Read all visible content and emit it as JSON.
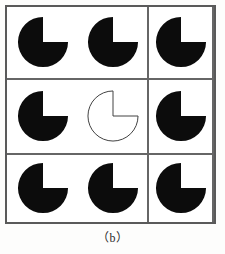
{
  "figure": {
    "caption": "（b）",
    "grid": {
      "rows": 3,
      "columns": 3,
      "border_color": "#5a5a5a",
      "divider_color": "#666666",
      "cell_background": "#ffffff"
    },
    "shape_defaults": {
      "name": "pacman",
      "wedge_start_deg": 0,
      "wedge_end_deg": 90,
      "wedge_span_deg": 90,
      "wedge_direction": "upper-right",
      "radius_px": 26
    },
    "cells": [
      {
        "index": 0,
        "row": 0,
        "column": 0,
        "position_label": "top-left",
        "shape": "pacman",
        "fill": "#0c0c0c",
        "stroke": "none",
        "stroke_width": 0,
        "filled": true,
        "wedge_start_deg": 0,
        "wedge_end_deg": 90
      },
      {
        "index": 1,
        "row": 0,
        "column": 1,
        "position_label": "top-center",
        "shape": "pacman",
        "fill": "#0c0c0c",
        "stroke": "none",
        "stroke_width": 0,
        "filled": true,
        "wedge_start_deg": 0,
        "wedge_end_deg": 90
      },
      {
        "index": 2,
        "row": 0,
        "column": 2,
        "position_label": "top-right",
        "shape": "pacman",
        "fill": "#0c0c0c",
        "stroke": "none",
        "stroke_width": 0,
        "filled": true,
        "wedge_start_deg": 0,
        "wedge_end_deg": 90
      },
      {
        "index": 3,
        "row": 1,
        "column": 0,
        "position_label": "middle-left",
        "shape": "pacman",
        "fill": "#0c0c0c",
        "stroke": "none",
        "stroke_width": 0,
        "filled": true,
        "wedge_start_deg": 0,
        "wedge_end_deg": 90
      },
      {
        "index": 4,
        "row": 1,
        "column": 1,
        "position_label": "middle-center",
        "shape": "pacman",
        "fill": "#ffffff",
        "stroke": "#3a3a3a",
        "stroke_width": 1,
        "filled": false,
        "wedge_start_deg": 0,
        "wedge_end_deg": 90
      },
      {
        "index": 5,
        "row": 1,
        "column": 2,
        "position_label": "middle-right",
        "shape": "pacman",
        "fill": "#0c0c0c",
        "stroke": "none",
        "stroke_width": 0,
        "filled": true,
        "wedge_start_deg": 0,
        "wedge_end_deg": 90
      },
      {
        "index": 6,
        "row": 2,
        "column": 0,
        "position_label": "bottom-left",
        "shape": "pacman",
        "fill": "#0c0c0c",
        "stroke": "none",
        "stroke_width": 0,
        "filled": true,
        "wedge_start_deg": 0,
        "wedge_end_deg": 90
      },
      {
        "index": 7,
        "row": 2,
        "column": 1,
        "position_label": "bottom-center",
        "shape": "pacman",
        "fill": "#0c0c0c",
        "stroke": "none",
        "stroke_width": 0,
        "filled": true,
        "wedge_start_deg": 0,
        "wedge_end_deg": 90
      },
      {
        "index": 8,
        "row": 2,
        "column": 2,
        "position_label": "bottom-right",
        "shape": "pacman",
        "fill": "#0c0c0c",
        "stroke": "none",
        "stroke_width": 0,
        "filled": true,
        "wedge_start_deg": 0,
        "wedge_end_deg": 90
      }
    ]
  }
}
